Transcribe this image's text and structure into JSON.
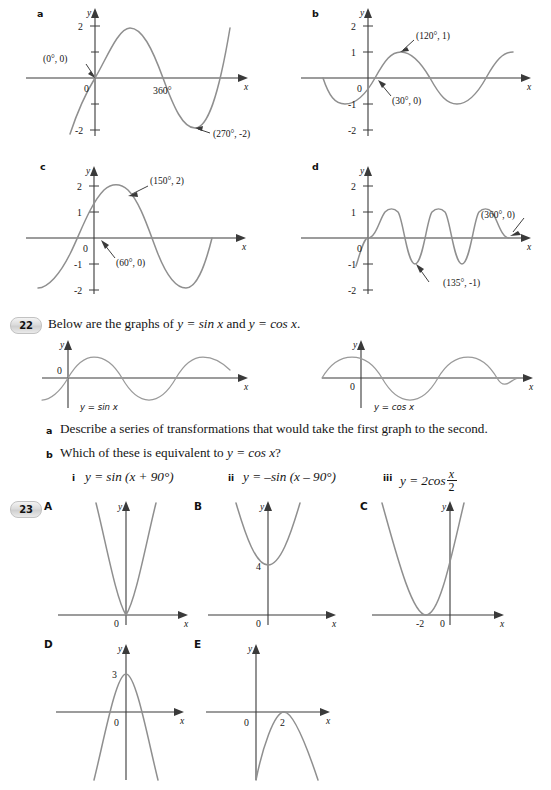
{
  "page": {
    "background": "#ffffff",
    "curve_color": "#8f8f8f",
    "axis_color": "#3a3a3a",
    "text_color": "#151515"
  },
  "q21_graphs": {
    "a": {
      "label": "a",
      "y_axis_label": "y",
      "x_axis_label": "x",
      "origin_label": "0",
      "y_ticks": [
        "2",
        "-2"
      ],
      "x_ticks": [
        "360°"
      ],
      "annotations": [
        {
          "text": "(0°, 0)",
          "point": "(0, 0)"
        },
        {
          "text": "(270°, -2)",
          "point": "(270, -2)"
        }
      ],
      "function_note": "amplitude 2, zero at 0°, minimum -2 at 270°"
    },
    "b": {
      "label": "b",
      "y_axis_label": "y",
      "x_axis_label": "x",
      "origin_label": "0",
      "y_ticks": [
        "2",
        "1",
        "-1",
        "-2"
      ],
      "annotations": [
        {
          "text": "(120°, 1)",
          "point": "(120, 1)"
        },
        {
          "text": "(30°, 0)",
          "point": "(30, 0)"
        }
      ],
      "function_note": "amplitude 1, rising zero at 30°, maximum 1 at 120°"
    },
    "c": {
      "label": "c",
      "y_axis_label": "y",
      "x_axis_label": "x",
      "origin_label": "0",
      "y_ticks": [
        "2",
        "1",
        "-1",
        "-2"
      ],
      "annotations": [
        {
          "text": "(150°, 2)",
          "point": "(150, 2)"
        },
        {
          "text": "(60°, 0)",
          "point": "(60, 0)"
        }
      ],
      "function_note": "amplitude 2, rising zero at 60°, maximum 2 at 150°"
    },
    "d": {
      "label": "d",
      "y_axis_label": "y",
      "x_axis_label": "x",
      "origin_label": "0",
      "y_ticks": [
        "2",
        "1",
        "-1",
        "-2"
      ],
      "annotations": [
        {
          "text": "(360°, 0)",
          "point": "(360, 0)"
        },
        {
          "text": "(135°, -1)",
          "point": "(135, -1)"
        }
      ],
      "function_note": "amplitude 1, period 180°, minimum -1 at 135°, zero at 360°"
    }
  },
  "q22": {
    "number": "22",
    "stem_before": "Below are the graphs of",
    "stem_eq1": "y = sin x",
    "stem_and": "and",
    "stem_eq2": "y = cos x",
    "stem_end": ".",
    "graph_left": {
      "caption": "y = sin x",
      "y_axis_label": "y",
      "x_axis_label": "x",
      "origin_label": "0"
    },
    "graph_right": {
      "caption": "y = cos x",
      "y_axis_label": "y",
      "x_axis_label": "x",
      "origin_label": "0"
    },
    "parts": [
      {
        "letter": "a",
        "text": "Describe a series of transformations that would take the first graph to the second."
      },
      {
        "letter": "b",
        "text_before": "Which of these is equivalent to",
        "text_eq": "y = cos x",
        "text_after": "?",
        "options": [
          {
            "numeral": "i",
            "text": "y = sin (x + 90°)"
          },
          {
            "numeral": "ii",
            "text": "y = –sin (x – 90°)"
          },
          {
            "numeral": "iii",
            "prefix": "y = 2cos",
            "frac_num": "x",
            "frac_den": "2"
          }
        ]
      }
    ]
  },
  "q23": {
    "number": "23",
    "graphs": [
      {
        "label": "A",
        "y_axis_label": "y",
        "x_axis_label": "x",
        "origin_label": "0",
        "marked_values": [],
        "shape": "upward parabola, vertex at origin, narrow"
      },
      {
        "label": "B",
        "y_axis_label": "y",
        "x_axis_label": "x",
        "origin_label": "0",
        "marked_values": [
          "4"
        ],
        "shape": "upward parabola, vertex at (0, 4)"
      },
      {
        "label": "C",
        "y_axis_label": "y",
        "x_axis_label": "x",
        "origin_label": "0",
        "marked_values": [
          "-2"
        ],
        "shape": "upward parabola, vertex at (-2, 0)"
      },
      {
        "label": "D",
        "y_axis_label": "y",
        "x_axis_label": "x",
        "origin_label": "0",
        "marked_values": [
          "3"
        ],
        "shape": "downward parabola, vertex at (0, 3)"
      },
      {
        "label": "E",
        "y_axis_label": "y",
        "x_axis_label": "x",
        "origin_label": "0",
        "marked_values": [
          "2"
        ],
        "shape": "downward parabola, vertex at (2, 0)"
      }
    ]
  }
}
